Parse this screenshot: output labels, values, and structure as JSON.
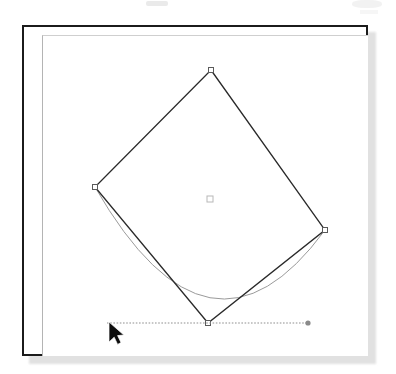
{
  "app": {
    "title": "Vector drawing canvas",
    "description": "Rotated square path with selection handles, an elliptical guide arc and a dotted horizontal guide line with a mouse pointer"
  },
  "colors": {
    "page_background": "#ffffff",
    "frame_border": "#1b1b1b",
    "inner_page_border": "#b4b4b4",
    "shape_stroke": "#2a2a2a",
    "arc_stroke": "#9a9a9a",
    "guide_stroke": "#8f8f8f",
    "handle_fill": "#ffffff",
    "handle_stroke": "#5a5a5a",
    "center_marker_stroke": "#b8b8b8",
    "cursor_fill": "#0d0d0d",
    "shadow": "#c9c9c9"
  },
  "canvas": {
    "frame": {
      "x": 22,
      "y": 25,
      "width": 346,
      "height": 331
    },
    "inner_page_offset": {
      "left": 18,
      "top": 8
    }
  },
  "shape": {
    "name": "rotated-square",
    "type": "closed-path",
    "points": [
      {
        "label": "top",
        "x": 187,
        "y": 43
      },
      {
        "label": "right",
        "x": 301,
        "y": 203
      },
      {
        "label": "bottom",
        "x": 184,
        "y": 296
      },
      {
        "label": "left",
        "x": 71,
        "y": 160
      }
    ],
    "center": {
      "x": 186,
      "y": 172
    },
    "handle_size": 5,
    "center_marker_size": 6
  },
  "arc": {
    "name": "guide-arc",
    "start": {
      "x": 71,
      "y": 160
    },
    "control": {
      "x": 186,
      "y": 360
    },
    "end": {
      "x": 301,
      "y": 203
    }
  },
  "guide": {
    "name": "baseline-guide",
    "start": {
      "x": 83,
      "y": 296
    },
    "end": {
      "x": 284,
      "y": 296
    },
    "endpoint_dot_radius": 2.6
  },
  "cursor": {
    "name": "mouse-pointer",
    "tip": {
      "x": 85,
      "y": 295
    },
    "rotation_deg": 0
  },
  "artifacts": [
    {
      "name": "scan-smudge-top-center"
    },
    {
      "name": "scan-smudge-top-right"
    },
    {
      "name": "scan-smudge-top-right-2"
    }
  ]
}
